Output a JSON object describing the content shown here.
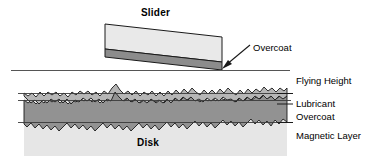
{
  "diagram": {
    "title_label": "Slider",
    "disk_label": "Disk",
    "callouts": {
      "overcoat_slider": "Overcoat"
    },
    "layer_labels": {
      "flying_height": "Flying Height",
      "lubricant": "Lubricant",
      "overcoat": "Overcoat",
      "magnetic_layer": "Magnetic Layer"
    },
    "colors": {
      "outline": "#1a1a1a",
      "slider_body": "#e8e8e8",
      "slider_overcoat": "#8c8c8c",
      "lubricant_layer": "#b3b3b3",
      "overcoat_layer": "#8f8f8f",
      "magnetic_layer": "#e4e4e4",
      "flying_height_line": "#555555",
      "leader_line": "#1a1a1a",
      "text": "#000000"
    }
  }
}
